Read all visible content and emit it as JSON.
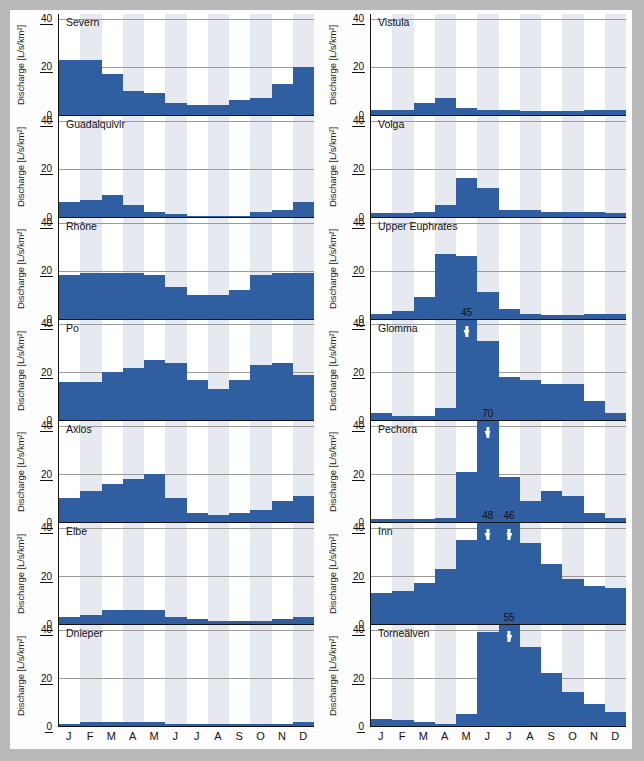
{
  "figure": {
    "ylabel": "Discharge [L/s/km²]",
    "yticks": [
      0,
      20,
      40
    ],
    "ymax": 42,
    "months": [
      "J",
      "F",
      "M",
      "A",
      "M",
      "J",
      "J",
      "A",
      "S",
      "O",
      "N",
      "D"
    ],
    "shaded_months": [
      1,
      3,
      5,
      7,
      9,
      11
    ],
    "bar_color": "#2f5fa0",
    "band_color": "#e6eaf0",
    "frame_color": "#b9b9b9"
  },
  "chart_data": {
    "type": "bar",
    "title": "",
    "xlabel": "",
    "ylabel": "Discharge [L/s/km²]",
    "ylim": [
      0,
      42
    ],
    "grid": true,
    "legend": "none",
    "categories": [
      "J",
      "F",
      "M",
      "A",
      "M",
      "J",
      "J",
      "A",
      "S",
      "O",
      "N",
      "D"
    ],
    "panels": [
      {
        "name": "Severn",
        "column": "left",
        "row": 1,
        "values": [
          23,
          23,
          17,
          10,
          9,
          5,
          4,
          4,
          6,
          7,
          13,
          20
        ],
        "annotations": []
      },
      {
        "name": "Guadalquivir",
        "column": "left",
        "row": 2,
        "values": [
          6,
          7,
          9,
          5,
          2,
          1,
          0.5,
          0.5,
          0.5,
          2,
          3,
          6
        ],
        "annotations": []
      },
      {
        "name": "Rhône",
        "column": "left",
        "row": 3,
        "values": [
          18,
          19,
          19,
          19,
          18,
          13,
          10,
          10,
          12,
          18,
          19,
          19
        ],
        "annotations": []
      },
      {
        "name": "Po",
        "column": "left",
        "row": 4,
        "values": [
          16,
          16,
          20,
          22,
          25,
          24,
          17,
          13,
          17,
          23,
          24,
          19
        ],
        "annotations": []
      },
      {
        "name": "Axios",
        "column": "left",
        "row": 5,
        "values": [
          10,
          13,
          16,
          18,
          20,
          10,
          4,
          3,
          4,
          5,
          9,
          11
        ],
        "annotations": []
      },
      {
        "name": "Elbe",
        "column": "left",
        "row": 6,
        "values": [
          3,
          4,
          6,
          6,
          6,
          3,
          2,
          1.5,
          1.5,
          1.5,
          2,
          3
        ],
        "annotations": []
      },
      {
        "name": "Dnieper",
        "column": "left",
        "row": 7,
        "values": [
          1,
          1.5,
          1.5,
          1.5,
          1.5,
          1,
          0.8,
          0.8,
          0.8,
          0.8,
          1,
          1.5
        ],
        "annotations": []
      },
      {
        "name": "Vistula",
        "column": "right",
        "row": 1,
        "values": [
          2,
          2,
          5,
          7,
          3,
          2,
          2,
          1.5,
          1.5,
          1.5,
          2,
          2
        ],
        "annotations": []
      },
      {
        "name": "Volga",
        "column": "right",
        "row": 2,
        "values": [
          1.5,
          1.5,
          2,
          5,
          16,
          12,
          3,
          3,
          2,
          2,
          2,
          1.5
        ],
        "annotations": []
      },
      {
        "name": "Upper Euphrates",
        "column": "right",
        "row": 3,
        "values": [
          2,
          3,
          9,
          27,
          26,
          11,
          4,
          2,
          1.5,
          1.5,
          2,
          2
        ],
        "annotations": []
      },
      {
        "name": "Glomma",
        "column": "right",
        "row": 4,
        "values": [
          3,
          2,
          2,
          5,
          45,
          33,
          18,
          17,
          15,
          15,
          8,
          3
        ],
        "annotations": [
          {
            "month": "M",
            "month_index": 4,
            "value": 45,
            "clipped": true
          }
        ]
      },
      {
        "name": "Pechora",
        "column": "right",
        "row": 5,
        "values": [
          1.5,
          1.5,
          1.5,
          2,
          21,
          70,
          19,
          9,
          13,
          11,
          4,
          2
        ],
        "annotations": [
          {
            "month": "J",
            "month_index": 5,
            "value": 70,
            "clipped": true
          }
        ]
      },
      {
        "name": "Inn",
        "column": "right",
        "row": 6,
        "values": [
          13,
          14,
          17,
          23,
          35,
          48,
          46,
          34,
          25,
          19,
          16,
          15
        ],
        "annotations": [
          {
            "month": "J",
            "month_index": 5,
            "value": 48,
            "clipped": true
          },
          {
            "month": "J",
            "month_index": 6,
            "value": 46,
            "clipped": true
          }
        ]
      },
      {
        "name": "Torneälven",
        "column": "right",
        "row": 7,
        "values": [
          3,
          2.5,
          1.5,
          1,
          5,
          39,
          55,
          33,
          22,
          14,
          9,
          6
        ],
        "annotations": [
          {
            "month": "J",
            "month_index": 6,
            "value": 55,
            "clipped": true
          }
        ]
      }
    ]
  }
}
